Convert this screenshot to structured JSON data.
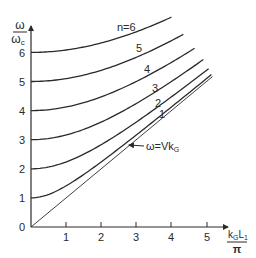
{
  "chart_data": {
    "type": "line",
    "title": "",
    "xlabel": "k_G L_1 / π",
    "ylabel": "ω / ω_c",
    "xlim": [
      0,
      5.5
    ],
    "ylim": [
      0,
      7.4
    ],
    "grid": false,
    "legend": "none (curves labeled inline)",
    "x_ticks": [
      "1",
      "2",
      "3",
      "4",
      "5"
    ],
    "y_ticks": [
      "0",
      "1",
      "2",
      "3",
      "4",
      "5",
      "6"
    ],
    "origin_label": "0",
    "formula_implied": "ω/ω_c = sqrt(n² + (k_G L_1/π)²)",
    "series": [
      {
        "name": "n=6",
        "label": "n=6",
        "n": 6,
        "x_end": 4.0,
        "points": [
          [
            0,
            6.0
          ],
          [
            1,
            6.08
          ],
          [
            2,
            6.32
          ],
          [
            3,
            6.71
          ],
          [
            4,
            7.21
          ]
        ]
      },
      {
        "name": "n=5",
        "label": "5",
        "n": 5,
        "x_end": 4.34,
        "points": [
          [
            0,
            5.0
          ],
          [
            1,
            5.1
          ],
          [
            2,
            5.39
          ],
          [
            3,
            5.83
          ],
          [
            4,
            6.4
          ],
          [
            4.34,
            6.62
          ]
        ]
      },
      {
        "name": "n=4",
        "label": "4",
        "n": 4,
        "x_end": 4.66,
        "points": [
          [
            0,
            4.0
          ],
          [
            1,
            4.12
          ],
          [
            2,
            4.47
          ],
          [
            3,
            5.0
          ],
          [
            4,
            5.66
          ],
          [
            4.66,
            6.14
          ]
        ]
      },
      {
        "name": "n=3",
        "label": "3",
        "n": 3,
        "x_end": 4.91,
        "points": [
          [
            0,
            3.0
          ],
          [
            1,
            3.16
          ],
          [
            2,
            3.61
          ],
          [
            3,
            4.24
          ],
          [
            4,
            5.0
          ],
          [
            4.91,
            5.75
          ]
        ]
      },
      {
        "name": "n=2",
        "label": "2",
        "n": 2,
        "x_end": 5.06,
        "points": [
          [
            0,
            2.0
          ],
          [
            1,
            2.24
          ],
          [
            2,
            2.83
          ],
          [
            3,
            3.61
          ],
          [
            4,
            4.47
          ],
          [
            5.06,
            5.44
          ]
        ]
      },
      {
        "name": "n=1",
        "label": "1",
        "n": 1,
        "x_end": 5.14,
        "points": [
          [
            0,
            1.0
          ],
          [
            1,
            1.41
          ],
          [
            2,
            2.24
          ],
          [
            3,
            3.16
          ],
          [
            4,
            4.12
          ],
          [
            5.14,
            5.24
          ]
        ]
      },
      {
        "name": "ω=Vk_G",
        "label": "ω=Vk_G",
        "n": 0,
        "x_end": 5.17,
        "points": [
          [
            0,
            0
          ],
          [
            5.17,
            5.17
          ]
        ],
        "style": "thin straight line (asymptote)"
      }
    ],
    "annotations": [
      {
        "text": "ω=Vk_G",
        "arrow_to": "asymptote line",
        "position": [
          3.3,
          2.7
        ]
      }
    ]
  },
  "labels": {
    "y_axis_num": "ω",
    "y_axis_den": "ω",
    "y_axis_den_sub": "c",
    "x_axis_num_k": "k",
    "x_axis_num_sub": "G",
    "x_axis_num_L": "L",
    "x_axis_num_L_sub": "1",
    "x_axis_den": "π",
    "origin": "0",
    "curve_n6": "n=6",
    "curve_5": "5",
    "curve_4": "4",
    "curve_3": "3",
    "curve_2": "2",
    "curve_1": "1",
    "annotation_main": "ω=Vk",
    "annotation_sub": "G"
  },
  "colors": {
    "ink": "#2a2a2a",
    "background": "#ffffff"
  }
}
